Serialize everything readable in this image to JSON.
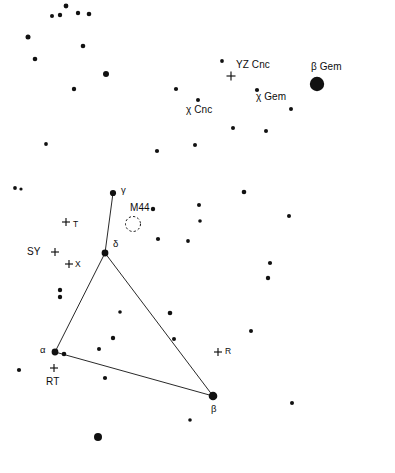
{
  "chart_data": {
    "type": "scatter",
    "title": "",
    "subtitle": "",
    "xlabel": "",
    "ylabel": "",
    "grid": false,
    "legend": "none",
    "background_color": "#ffffff",
    "marker_color": "#111111",
    "xlim": [
      0,
      395
    ],
    "ylim": [
      0,
      473
    ],
    "stars": [
      {
        "x": 66,
        "y": 6,
        "r": 2.4
      },
      {
        "x": 78,
        "y": 13,
        "r": 2.2
      },
      {
        "x": 52,
        "y": 16,
        "r": 2.0
      },
      {
        "x": 60,
        "y": 15,
        "r": 2.2
      },
      {
        "x": 89,
        "y": 14,
        "r": 2.3
      },
      {
        "x": 28,
        "y": 37,
        "r": 2.5
      },
      {
        "x": 83,
        "y": 46,
        "r": 2.3
      },
      {
        "x": 35,
        "y": 59,
        "r": 2.3
      },
      {
        "x": 106,
        "y": 74,
        "r": 3.0
      },
      {
        "x": 222,
        "y": 61,
        "r": 1.9
      },
      {
        "x": 74,
        "y": 89,
        "r": 2.2
      },
      {
        "x": 176,
        "y": 89,
        "r": 2.1
      },
      {
        "x": 257,
        "y": 90,
        "r": 2.1
      },
      {
        "x": 317,
        "y": 84,
        "r": 7.2
      },
      {
        "x": 198,
        "y": 100,
        "r": 2.0
      },
      {
        "x": 291,
        "y": 109,
        "r": 2.0
      },
      {
        "x": 233,
        "y": 128,
        "r": 2.0
      },
      {
        "x": 266,
        "y": 131,
        "r": 2.0
      },
      {
        "x": 46,
        "y": 144,
        "r": 1.9
      },
      {
        "x": 157,
        "y": 151,
        "r": 2.1
      },
      {
        "x": 195,
        "y": 145,
        "r": 2.0
      },
      {
        "x": 15,
        "y": 188,
        "r": 1.9
      },
      {
        "x": 21,
        "y": 189,
        "r": 1.6
      },
      {
        "x": 113,
        "y": 193,
        "r": 3.1
      },
      {
        "x": 244,
        "y": 192,
        "r": 2.3
      },
      {
        "x": 153,
        "y": 209,
        "r": 2.2
      },
      {
        "x": 199,
        "y": 205,
        "r": 2.0
      },
      {
        "x": 289,
        "y": 216,
        "r": 2.0
      },
      {
        "x": 200,
        "y": 221,
        "r": 1.8
      },
      {
        "x": 105,
        "y": 253,
        "r": 3.4
      },
      {
        "x": 158,
        "y": 239,
        "r": 2.1
      },
      {
        "x": 188,
        "y": 241,
        "r": 1.9
      },
      {
        "x": 270,
        "y": 263,
        "r": 2.1
      },
      {
        "x": 268,
        "y": 278,
        "r": 2.2
      },
      {
        "x": 60,
        "y": 290,
        "r": 2.2
      },
      {
        "x": 60,
        "y": 297,
        "r": 2.2
      },
      {
        "x": 120,
        "y": 312,
        "r": 1.8
      },
      {
        "x": 170,
        "y": 313,
        "r": 2.3
      },
      {
        "x": 251,
        "y": 331,
        "r": 2.0
      },
      {
        "x": 174,
        "y": 339,
        "r": 2.0
      },
      {
        "x": 113,
        "y": 338,
        "r": 2.2
      },
      {
        "x": 99,
        "y": 349,
        "r": 2.0
      },
      {
        "x": 55,
        "y": 352,
        "r": 3.4
      },
      {
        "x": 64,
        "y": 354,
        "r": 2.3
      },
      {
        "x": 19,
        "y": 370,
        "r": 2.1
      },
      {
        "x": 105,
        "y": 378,
        "r": 2.1
      },
      {
        "x": 213,
        "y": 396,
        "r": 4.3
      },
      {
        "x": 292,
        "y": 403,
        "r": 2.0
      },
      {
        "x": 190,
        "y": 420,
        "r": 1.8
      },
      {
        "x": 98,
        "y": 437,
        "r": 4.0
      }
    ],
    "constellation_lines": [
      {
        "name": "gamma-to-delta",
        "points": [
          [
            113,
            193
          ],
          [
            105,
            253
          ]
        ]
      },
      {
        "name": "delta-to-alpha",
        "points": [
          [
            105,
            253
          ],
          [
            55,
            352
          ]
        ]
      },
      {
        "name": "delta-to-beta",
        "points": [
          [
            105,
            253
          ],
          [
            213,
            396
          ]
        ]
      },
      {
        "name": "alpha-to-beta",
        "points": [
          [
            55,
            352
          ],
          [
            213,
            396
          ]
        ]
      }
    ],
    "variable_star_markers": [
      {
        "label": "YZ Cnc",
        "x": 231,
        "y": 76,
        "size": 9
      },
      {
        "label": "T",
        "x": 66,
        "y": 222,
        "size": 8
      },
      {
        "label": "SY",
        "x": 55,
        "y": 252,
        "size": 8
      },
      {
        "label": "X",
        "x": 69,
        "y": 264,
        "size": 8
      },
      {
        "label": "R",
        "x": 218,
        "y": 352,
        "size": 8
      },
      {
        "label": "RT",
        "x": 54,
        "y": 368,
        "size": 8
      }
    ],
    "cluster_markers": [
      {
        "label": "M44",
        "x": 133,
        "y": 224,
        "radius": 7.5,
        "style": "dashed-circle"
      }
    ],
    "labels": [
      {
        "name": "yz-cnc-label",
        "text": "YZ Cnc",
        "x": 236,
        "y": 60,
        "size": "bigger"
      },
      {
        "name": "beta-gem-label",
        "text": "β Gem",
        "x": 311,
        "y": 62,
        "size": "bigger"
      },
      {
        "name": "chi-gem-label",
        "text": "χ Gem",
        "x": 256,
        "y": 92,
        "size": "bigger"
      },
      {
        "name": "chi-cnc-label",
        "text": "χ Cnc",
        "x": 186,
        "y": 105,
        "size": "bigger"
      },
      {
        "name": "gamma-label",
        "text": "γ",
        "x": 121,
        "y": 185,
        "size": "greek"
      },
      {
        "name": "m44-label",
        "text": "M44",
        "x": 130,
        "y": 203,
        "size": "bigger"
      },
      {
        "name": "t-label",
        "text": "T",
        "x": 73,
        "y": 220,
        "size": "small"
      },
      {
        "name": "delta-label",
        "text": "δ",
        "x": 113,
        "y": 239,
        "size": "greek"
      },
      {
        "name": "sy-label",
        "text": "SY",
        "x": 27,
        "y": 247,
        "size": "bigger"
      },
      {
        "name": "x-label",
        "text": "X",
        "x": 75,
        "y": 260,
        "size": "small"
      },
      {
        "name": "alpha-label",
        "text": "α",
        "x": 40,
        "y": 345,
        "size": "greek"
      },
      {
        "name": "r-label",
        "text": "R",
        "x": 225,
        "y": 347,
        "size": "small"
      },
      {
        "name": "rt-label",
        "text": "RT",
        "x": 46,
        "y": 377,
        "size": "bigger"
      },
      {
        "name": "beta-label",
        "text": "β",
        "x": 211,
        "y": 404,
        "size": "greek"
      }
    ]
  }
}
